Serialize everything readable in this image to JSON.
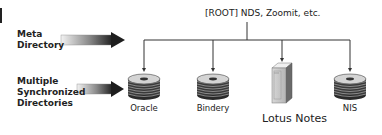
{
  "root": {
    "label": "[ROOT] NDS, Zoomit, etc."
  },
  "side_labels": {
    "meta": [
      "Meta",
      "Directory"
    ],
    "multiple": [
      "Multiple",
      "Synchronized",
      "Directories"
    ]
  },
  "nodes": [
    {
      "label": "Oracle",
      "icon": "database-disk-stack-icon"
    },
    {
      "label": "Bindery",
      "icon": "database-disk-stack-icon"
    },
    {
      "label": "Lotus Notes",
      "icon": "server-tower-icon"
    },
    {
      "label": "NIS",
      "icon": "database-disk-stack-icon"
    }
  ]
}
